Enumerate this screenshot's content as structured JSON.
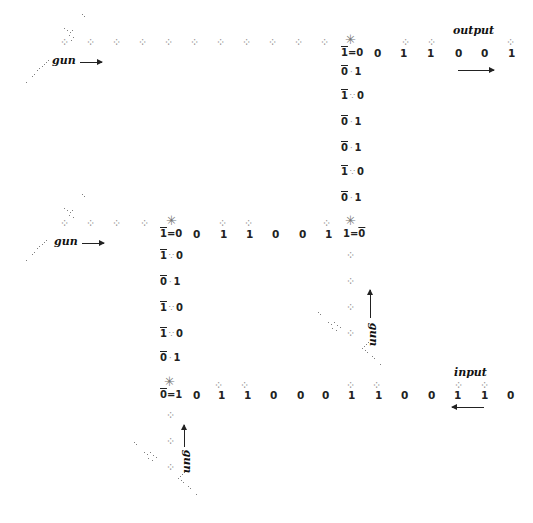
{
  "labels": {
    "gun_top": "gun",
    "gun_middle": "gun",
    "gun_right_vertical": "gun",
    "gun_bottom_vertical": "gun",
    "output": "output",
    "input": "input"
  },
  "top_stream": {
    "collision": {
      "left": "1",
      "sep": "=",
      "right": "0",
      "left_overline": true
    },
    "bits": [
      "0",
      "1",
      "1",
      "0",
      "0",
      "1"
    ]
  },
  "top_column": [
    {
      "a": "0",
      "sep": "·",
      "b": "1"
    },
    {
      "a": "1",
      "sep": "∵",
      "b": "0"
    },
    {
      "a": "0",
      "sep": "·",
      "b": "1"
    },
    {
      "a": "0",
      "sep": "·",
      "b": "1"
    },
    {
      "a": "1",
      "sep": "∵",
      "b": "0"
    },
    {
      "a": "0",
      "sep": "·",
      "b": "1"
    }
  ],
  "middle_stream": {
    "collision_left": {
      "left": "1",
      "sep": "=",
      "right": "0"
    },
    "bits": [
      "0",
      "1",
      "1",
      "0",
      "0",
      "1"
    ],
    "collision_right": {
      "left": "1",
      "sep": "=",
      "right": "0"
    }
  },
  "middle_column": [
    {
      "a": "1",
      "sep": "∵",
      "b": "0"
    },
    {
      "a": "0",
      "sep": "·",
      "b": "1"
    },
    {
      "a": "1",
      "sep": "∵",
      "b": "0"
    },
    {
      "a": "1",
      "sep": "∵",
      "b": "0"
    },
    {
      "a": "0",
      "sep": "·",
      "b": "1"
    }
  ],
  "bottom_stream": {
    "collision": {
      "left": "0",
      "sep": "=",
      "right": "1"
    },
    "bits": [
      "0",
      "1",
      "1",
      "0",
      "0",
      "0",
      "1",
      "1",
      "0",
      "0",
      "1",
      "1",
      "0"
    ]
  }
}
